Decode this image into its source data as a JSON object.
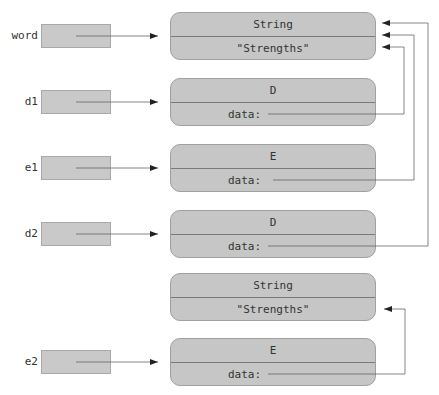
{
  "variables": [
    {
      "name": "word",
      "points_to": "string1"
    },
    {
      "name": "d1",
      "points_to": "d_obj1"
    },
    {
      "name": "e1",
      "points_to": "e_obj1"
    },
    {
      "name": "d2",
      "points_to": "d_obj2"
    },
    {
      "name": "e2",
      "points_to": "e_obj2"
    }
  ],
  "objects": [
    {
      "id": "string1",
      "type": "String",
      "value": "\"Strengths\""
    },
    {
      "id": "d_obj1",
      "type": "D",
      "field": "data:",
      "field_points_to": "string1"
    },
    {
      "id": "e_obj1",
      "type": "E",
      "field": "data:",
      "field_points_to": "string1"
    },
    {
      "id": "d_obj2",
      "type": "D",
      "field": "data:",
      "field_points_to": "string1"
    },
    {
      "id": "string2",
      "type": "String",
      "value": "\"Strengths\""
    },
    {
      "id": "e_obj2",
      "type": "E",
      "field": "data:",
      "field_points_to": "string2"
    }
  ],
  "colors": {
    "box_fill": "#c6c6c6",
    "box_border": "#a0a0a0",
    "divider": "#7a7a7a",
    "arrow": "#555555",
    "text": "#333333"
  }
}
